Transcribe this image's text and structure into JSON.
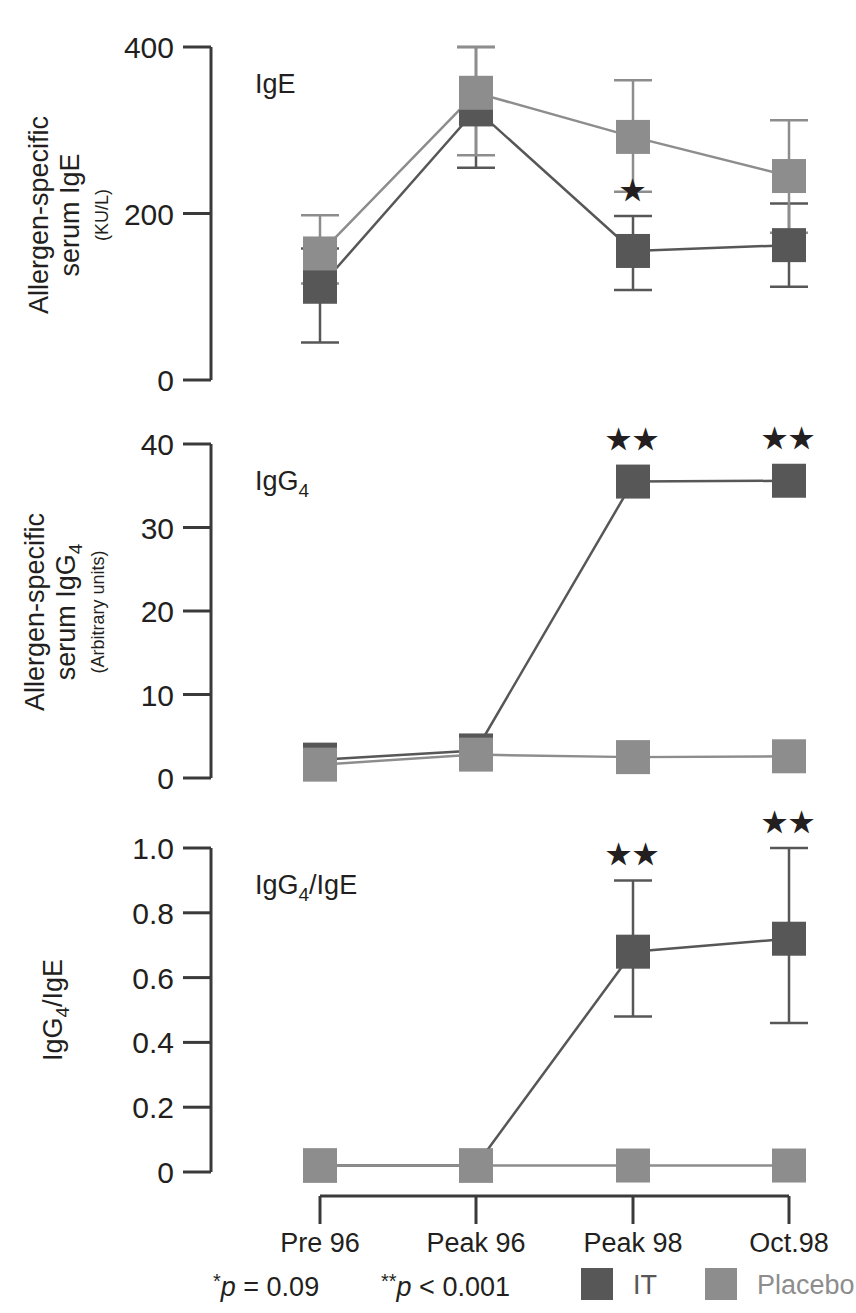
{
  "figure": {
    "background": "#ffffff",
    "ink": "#231f20"
  },
  "colors": {
    "it": "#575757",
    "placebo": "#8d8d8d",
    "axis": "#3a3a3a"
  },
  "categories": [
    "Pre 96",
    "Peak 96",
    "Peak 98",
    "Oct.98"
  ],
  "legend": {
    "p_one_star": "*p = 0.09",
    "p_two_star": "**p < 0.001",
    "series": [
      {
        "key": "it",
        "label": "IT",
        "color": "#575757"
      },
      {
        "key": "placebo",
        "label": "Placebo",
        "color": "#8d8d8d"
      }
    ]
  },
  "panels": [
    {
      "id": "ige",
      "panel_label": "IgE",
      "panel_label_sub": "",
      "axis_title_line1": "Allergen-specific",
      "axis_title_line2": "serum IgE",
      "axis_units": "(KU/L)",
      "ticks": [
        "400",
        "200",
        "0"
      ],
      "ylim": [
        0,
        400
      ],
      "tick_values": [
        400,
        200,
        0
      ],
      "significance": [
        {
          "category": "Peak 98",
          "marks": "*"
        }
      ]
    },
    {
      "id": "igg4",
      "panel_label": "IgG",
      "panel_label_sub": "4",
      "axis_title_line1": "Allergen-specific",
      "axis_title_line2": "serum IgG",
      "axis_title_line2_sub": "4",
      "axis_units": "(Arbitrary units)",
      "ticks": [
        "40",
        "30",
        "20",
        "10",
        "0"
      ],
      "ylim": [
        0,
        40
      ],
      "tick_values": [
        40,
        30,
        20,
        10,
        0
      ],
      "significance": [
        {
          "category": "Peak 98",
          "marks": "★★"
        },
        {
          "category": "Oct.98",
          "marks": "★★"
        }
      ]
    },
    {
      "id": "ratio",
      "panel_label": "IgG",
      "panel_label_sub": "4",
      "panel_label_tail": "/IgE",
      "axis_title_line1": "IgG",
      "axis_title_line1_sub": "4",
      "axis_title_line1_tail": "/IgE",
      "axis_units": "",
      "ticks": [
        "1.0",
        "0.8",
        "0.6",
        "0.4",
        "0.2",
        "0"
      ],
      "ylim": [
        0,
        1.0
      ],
      "tick_values": [
        1.0,
        0.8,
        0.6,
        0.4,
        0.2,
        0
      ],
      "significance": [
        {
          "category": "Peak 98",
          "marks": "★★"
        },
        {
          "category": "Oct.98",
          "marks": "★★"
        }
      ]
    }
  ],
  "chart_data": [
    {
      "type": "line",
      "id": "ige",
      "title": "IgE",
      "xlabel": "",
      "ylabel": "Allergen-specific serum IgE (KU/L)",
      "categories": [
        "Pre 96",
        "Peak 96",
        "Peak 98",
        "Oct.98"
      ],
      "ylim": [
        0,
        400
      ],
      "yticks": [
        0,
        200,
        400
      ],
      "grid": false,
      "legend_position": "bottom",
      "series": [
        {
          "name": "IT",
          "color": "#575757",
          "values": [
            112,
            325,
            155,
            162
          ],
          "err_low": [
            45,
            255,
            108,
            112
          ],
          "err_high": [
            158,
            400,
            197,
            212
          ],
          "annotations": [
            "",
            "",
            "*",
            ""
          ]
        },
        {
          "name": "Placebo",
          "color": "#8d8d8d",
          "values": [
            152,
            345,
            292,
            245
          ],
          "err_low": [
            116,
            270,
            226,
            177
          ],
          "err_high": [
            198,
            400,
            360,
            312
          ],
          "annotations": [
            "",
            "",
            "",
            ""
          ]
        }
      ]
    },
    {
      "type": "line",
      "id": "igg4",
      "title": "IgG4",
      "xlabel": "",
      "ylabel": "Allergen-specific serum IgG4 (Arbitrary units)",
      "categories": [
        "Pre 96",
        "Peak 96",
        "Peak 98",
        "Oct.98"
      ],
      "ylim": [
        0,
        40
      ],
      "yticks": [
        0,
        10,
        20,
        30,
        40
      ],
      "grid": false,
      "legend_position": "bottom",
      "series": [
        {
          "name": "IT",
          "color": "#575757",
          "values": [
            2.2,
            3.3,
            35.5,
            35.6
          ],
          "err_low": [
            2.2,
            3.3,
            35.5,
            35.6
          ],
          "err_high": [
            2.2,
            3.3,
            35.5,
            35.6
          ],
          "annotations": [
            "",
            "",
            "**",
            "**"
          ]
        },
        {
          "name": "Placebo",
          "color": "#8d8d8d",
          "values": [
            1.6,
            2.8,
            2.5,
            2.6
          ],
          "err_low": [
            1.6,
            2.8,
            2.5,
            2.6
          ],
          "err_high": [
            1.6,
            2.8,
            2.5,
            2.6
          ],
          "annotations": [
            "",
            "",
            "",
            ""
          ]
        }
      ]
    },
    {
      "type": "line",
      "id": "ratio",
      "title": "IgG4/IgE",
      "xlabel": "",
      "ylabel": "IgG4/IgE",
      "categories": [
        "Pre 96",
        "Peak 96",
        "Peak 98",
        "Oct.98"
      ],
      "ylim": [
        0,
        1.0
      ],
      "yticks": [
        0,
        0.2,
        0.4,
        0.6,
        0.8,
        1.0
      ],
      "grid": false,
      "legend_position": "bottom",
      "series": [
        {
          "name": "IT",
          "color": "#575757",
          "values": [
            0.02,
            0.02,
            0.68,
            0.72
          ],
          "err_low": [
            0.02,
            0.02,
            0.48,
            0.46
          ],
          "err_high": [
            0.02,
            0.02,
            0.9,
            1.0
          ],
          "annotations": [
            "",
            "",
            "**",
            "**"
          ]
        },
        {
          "name": "Placebo",
          "color": "#8d8d8d",
          "values": [
            0.02,
            0.02,
            0.02,
            0.02
          ],
          "err_low": [
            0.02,
            0.02,
            0.02,
            0.02
          ],
          "err_high": [
            0.02,
            0.02,
            0.02,
            0.02
          ],
          "annotations": [
            "",
            "",
            "",
            ""
          ]
        }
      ]
    }
  ]
}
